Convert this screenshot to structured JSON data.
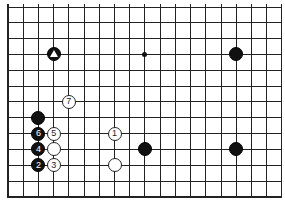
{
  "diagram": {
    "type": "go-board-fragment",
    "grid": {
      "columns": 19,
      "rows": 13,
      "origin_x": 8,
      "origin_y": 7,
      "col_spacing": 15.22,
      "row_spacing": 15.83,
      "thick_edges": [
        "left",
        "bottom"
      ],
      "line_color": "#222222"
    },
    "hoshi": [
      {
        "col": 9,
        "row": 3
      }
    ],
    "stones": [
      {
        "color": "black",
        "col": 3,
        "row": 3,
        "label": "",
        "marker": "triangle"
      },
      {
        "color": "black",
        "col": 15,
        "row": 3,
        "label": ""
      },
      {
        "color": "white",
        "col": 4,
        "row": 6,
        "label": "7"
      },
      {
        "color": "black",
        "col": 2,
        "row": 7,
        "label": ""
      },
      {
        "color": "black",
        "col": 2,
        "row": 8,
        "label": "6"
      },
      {
        "color": "white",
        "col": 3,
        "row": 8,
        "label": "5"
      },
      {
        "color": "white",
        "col": 7,
        "row": 8,
        "label": "1"
      },
      {
        "color": "black",
        "col": 2,
        "row": 9,
        "label": "4"
      },
      {
        "color": "white",
        "col": 3,
        "row": 9,
        "label": ""
      },
      {
        "color": "black",
        "col": 9,
        "row": 9,
        "label": ""
      },
      {
        "color": "black",
        "col": 15,
        "row": 9,
        "label": ""
      },
      {
        "color": "black",
        "col": 2,
        "row": 10,
        "label": "2"
      },
      {
        "color": "white",
        "col": 3,
        "row": 10,
        "label": "3"
      },
      {
        "color": "white",
        "col": 7,
        "row": 10,
        "label": ""
      }
    ]
  }
}
